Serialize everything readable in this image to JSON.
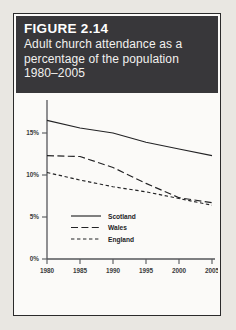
{
  "figure": {
    "number_label": "FIGURE 2.14",
    "caption_lines": [
      "Adult church attendance as a",
      "percentage of the population",
      "1980–2005"
    ]
  },
  "colors": {
    "banner_background": "#38373a",
    "banner_text": "#ffffff",
    "paper": "#fbfaf8",
    "page_background": "#e9e7e2",
    "border": "#2b2b2b",
    "ink": "#232325",
    "axis": "#55565a"
  },
  "chart_data": {
    "type": "line",
    "title": "Adult church attendance as a percentage of the population 1980–2005",
    "xlabel": "",
    "ylabel": "",
    "x": [
      1980,
      1985,
      1990,
      1995,
      2000,
      2005
    ],
    "xtick_labels": [
      "1980",
      "1985",
      "1990",
      "1995",
      "2000",
      "2005"
    ],
    "ytick_values": [
      0,
      5,
      10,
      15
    ],
    "ytick_labels": [
      "0%",
      "5%",
      "10%",
      "15%"
    ],
    "xlim": [
      1980,
      2005
    ],
    "ylim": [
      0,
      17.5
    ],
    "grid": false,
    "legend_position": "bottom-left",
    "series": [
      {
        "name": "Scotland",
        "style": "solid",
        "values": [
          16.5,
          15.6,
          15.0,
          13.9,
          13.1,
          12.3
        ]
      },
      {
        "name": "Wales",
        "style": "long-dash",
        "values": [
          12.3,
          12.2,
          10.9,
          9.0,
          7.3,
          6.7
        ]
      },
      {
        "name": "England",
        "style": "short-dash",
        "values": [
          10.3,
          9.4,
          8.6,
          8.0,
          7.2,
          6.4
        ]
      }
    ]
  },
  "legend": {
    "entries": [
      {
        "label": "Scotland",
        "style": "solid"
      },
      {
        "label": "Wales",
        "style": "long-dash"
      },
      {
        "label": "England",
        "style": "short-dash"
      }
    ]
  }
}
